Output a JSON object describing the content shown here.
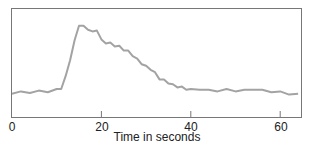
{
  "chart_data": {
    "type": "line",
    "title": "",
    "xlabel": "Time in seconds",
    "ylabel": "",
    "xlim": [
      0,
      65
    ],
    "ylim": [
      0,
      100
    ],
    "grid": false,
    "legend": null,
    "x_ticks": [
      0,
      20,
      40,
      60
    ],
    "x_tick_labels": [
      "0",
      "20",
      "40",
      "60"
    ],
    "line_color": "#a3a3a3",
    "series": [
      {
        "name": "signal",
        "x": [
          0,
          2,
          4,
          6,
          8,
          10,
          11,
          12,
          13,
          14,
          15,
          16,
          17,
          18,
          19,
          20,
          21,
          22,
          23,
          24,
          25,
          26,
          27,
          28,
          29,
          30,
          31,
          32,
          33,
          34,
          35,
          36,
          37,
          38,
          39,
          40,
          42,
          44,
          46,
          48,
          50,
          52,
          54,
          56,
          58,
          60,
          62,
          64
        ],
        "y": [
          10,
          11,
          11,
          12,
          12,
          14,
          16,
          30,
          52,
          75,
          95,
          93,
          90,
          86,
          89,
          76,
          73,
          72,
          69,
          68,
          64,
          62,
          57,
          52,
          47,
          43,
          40,
          35,
          28,
          26,
          23,
          20,
          18,
          17,
          15,
          14,
          15,
          13,
          13,
          14,
          13,
          13,
          15,
          13,
          12,
          11,
          9,
          8
        ]
      }
    ]
  }
}
